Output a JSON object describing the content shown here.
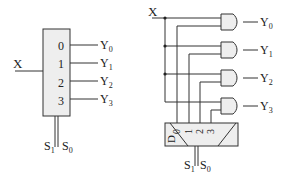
{
  "demux_block": {
    "input_label": "X",
    "output_indices": [
      "0",
      "1",
      "2",
      "3"
    ],
    "outputs": [
      {
        "name": "Y",
        "sub": "0"
      },
      {
        "name": "Y",
        "sub": "1"
      },
      {
        "name": "Y",
        "sub": "2"
      },
      {
        "name": "Y",
        "sub": "3"
      }
    ],
    "select": [
      {
        "name": "S",
        "sub": "1"
      },
      {
        "name": "S",
        "sub": "0"
      }
    ]
  },
  "gate_implementation": {
    "input_label": "X",
    "decoder_label": "D",
    "decoder_outputs": [
      "0",
      "1",
      "2",
      "3"
    ],
    "outputs": [
      {
        "name": "Y",
        "sub": "0"
      },
      {
        "name": "Y",
        "sub": "1"
      },
      {
        "name": "Y",
        "sub": "2"
      },
      {
        "name": "Y",
        "sub": "3"
      }
    ],
    "select": [
      {
        "name": "S",
        "sub": "1"
      },
      {
        "name": "S",
        "sub": "0"
      }
    ],
    "gate_type": "AND"
  },
  "colors": {
    "line": "#333333",
    "fill": "#eeeeee",
    "text": "#222222"
  }
}
